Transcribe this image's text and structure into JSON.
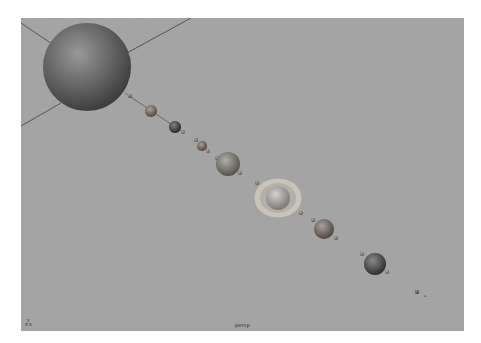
{
  "viewport": {
    "camera_label": "persp",
    "axis_indicator": {
      "y_label": "Y",
      "x_label": "X",
      "z_label": "Z"
    },
    "background_color": "#a4a4a4",
    "scene": {
      "grid_color": "#999999",
      "axis_line_color": "#333333",
      "orbit_line_color": "#555555",
      "bodies": [
        {
          "name": "sun",
          "cx": 66,
          "cy": 49,
          "r": 44,
          "color": "#616161"
        },
        {
          "name": "planet-1",
          "cx": 109,
          "cy": 78,
          "r": 2,
          "color": "#7a6f6a"
        },
        {
          "name": "planet-2",
          "cx": 130,
          "cy": 93,
          "r": 6,
          "color": "#7d6f66"
        },
        {
          "name": "planet-3",
          "cx": 154,
          "cy": 109,
          "r": 6,
          "color": "#3c3c3c"
        },
        {
          "name": "moon-3",
          "cx": 162,
          "cy": 114,
          "r": 2,
          "color": "#8a7e76"
        },
        {
          "name": "planet-4a",
          "cx": 175,
          "cy": 122,
          "r": 2,
          "color": "#8a7e76"
        },
        {
          "name": "planet-4",
          "cx": 181,
          "cy": 128,
          "r": 5,
          "color": "#7a6b62"
        },
        {
          "name": "moon-4",
          "cx": 187,
          "cy": 133,
          "r": 2,
          "color": "#8a7e76"
        },
        {
          "name": "planet-5a",
          "cx": 196,
          "cy": 140,
          "r": 2,
          "color": "#8a7e76"
        },
        {
          "name": "planet-5",
          "cx": 207,
          "cy": 146,
          "r": 12,
          "color": "#868079"
        },
        {
          "name": "moon-5",
          "cx": 219,
          "cy": 155,
          "r": 2,
          "color": "#8a7e76"
        },
        {
          "name": "planet-6a",
          "cx": 236,
          "cy": 165,
          "r": 2,
          "color": "#8a7e76"
        },
        {
          "name": "saturn",
          "cx": 257,
          "cy": 180,
          "r": 12,
          "color": "#bdbab5",
          "ring_rx": 24,
          "ring_ry": 20,
          "ring_color": "#c8c4bc"
        },
        {
          "name": "moon-6",
          "cx": 280,
          "cy": 195,
          "r": 2,
          "color": "#8a7e76"
        },
        {
          "name": "planet-7a",
          "cx": 292,
          "cy": 202,
          "r": 2,
          "color": "#8a7e76"
        },
        {
          "name": "planet-7",
          "cx": 303,
          "cy": 211,
          "r": 10,
          "color": "#7b6d66"
        },
        {
          "name": "moon-7",
          "cx": 315,
          "cy": 220,
          "r": 2,
          "color": "#8a7e76"
        },
        {
          "name": "planet-8a",
          "cx": 341,
          "cy": 236,
          "r": 2,
          "color": "#8a7e76"
        },
        {
          "name": "planet-8",
          "cx": 354,
          "cy": 246,
          "r": 11,
          "color": "#4a4a4a"
        },
        {
          "name": "moon-8",
          "cx": 366,
          "cy": 254,
          "r": 2,
          "color": "#8a7e76"
        },
        {
          "name": "pluto",
          "cx": 396,
          "cy": 274,
          "r": 2,
          "color": "#555555"
        },
        {
          "name": "pluto-moon",
          "cx": 404,
          "cy": 278,
          "r": 1,
          "color": "#777777"
        }
      ]
    }
  }
}
